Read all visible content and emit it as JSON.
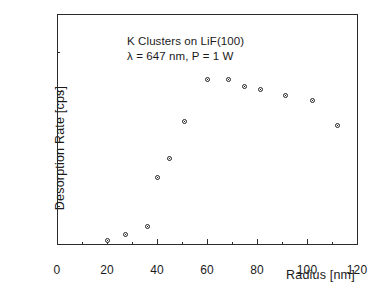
{
  "chart_data": {
    "type": "scatter",
    "title": "",
    "xlabel": "Radius [nm]",
    "ylabel": "Desorption Rate [cps]",
    "xlim": [
      0,
      120
    ],
    "ylim": [
      0,
      300
    ],
    "grid": false,
    "legend": null,
    "x_major_ticks": [
      0,
      20,
      40,
      60,
      80,
      100,
      120
    ],
    "x_minor_ticks": [
      10,
      30,
      50,
      70,
      90,
      110
    ],
    "y_major_ticks": [
      0,
      100,
      200,
      300
    ],
    "y_minor_ticks": [
      50,
      150,
      250
    ],
    "x_ticklabels": [
      "0",
      "20",
      "40",
      "60",
      "80",
      "100",
      "120"
    ],
    "y_ticklabels": [
      "0",
      "100",
      "200",
      "300"
    ],
    "marker": "open-circle",
    "series": [
      {
        "name": "K Clusters on LiF(100)",
        "points": [
          {
            "x": 20.0,
            "y": 5
          },
          {
            "x": 27.5,
            "y": 13
          },
          {
            "x": 36.0,
            "y": 23
          },
          {
            "x": 40.0,
            "y": 87
          },
          {
            "x": 45.0,
            "y": 111
          },
          {
            "x": 51.0,
            "y": 160
          },
          {
            "x": 60.0,
            "y": 215
          },
          {
            "x": 68.5,
            "y": 214
          },
          {
            "x": 75.0,
            "y": 206
          },
          {
            "x": 81.5,
            "y": 202
          },
          {
            "x": 91.5,
            "y": 194
          },
          {
            "x": 102.0,
            "y": 187
          },
          {
            "x": 112.0,
            "y": 154
          }
        ]
      }
    ],
    "annotations": [
      {
        "text": "K Clusters on LiF(100)"
      },
      {
        "text": "λ = 647 nm, P = 1 W"
      }
    ]
  },
  "colors": {
    "axis": "#2b2b2b",
    "marker_edge": "#222222",
    "marker_face": "#ffffff",
    "background": "#ffffff",
    "text": "#1a1a1a"
  }
}
